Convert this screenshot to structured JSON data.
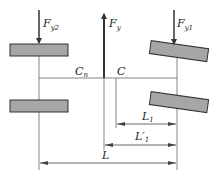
{
  "diagram": {
    "forces": {
      "left": {
        "label": "F",
        "sub": "y2"
      },
      "center": {
        "label": "F",
        "sub": "y"
      },
      "right": {
        "label": "F",
        "sub": "y1"
      }
    },
    "points": {
      "cn": {
        "label": "C",
        "sub": "n"
      },
      "c": {
        "label": "C"
      }
    },
    "dimensions": {
      "l1": {
        "label": "L",
        "sub": "1"
      },
      "l1prime": {
        "label": "L′",
        "sub": "1"
      },
      "l": {
        "label": "L"
      }
    },
    "colors": {
      "tire_fill": "#a6a6a6",
      "tire_stroke": "#333333",
      "line": "#555555",
      "arrow": "#333333"
    }
  }
}
